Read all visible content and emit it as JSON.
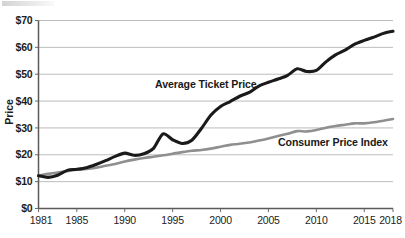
{
  "chart_data": {
    "type": "line",
    "title": "",
    "subtitle": "",
    "xlabel": "",
    "ylabel": "Price",
    "xlim": [
      1981,
      2018
    ],
    "ylim": [
      0,
      70
    ],
    "grid": true,
    "grid_axis": "y",
    "legend_position": "inline-annotations",
    "x_ticks": [
      1981,
      1985,
      1990,
      1995,
      2000,
      2005,
      2010,
      2015,
      2018
    ],
    "x_tick_labels": [
      "1981",
      "1985",
      "1990",
      "1995",
      "2000",
      "2005",
      "2010",
      "2015",
      "2018"
    ],
    "y_ticks": [
      0,
      10,
      20,
      30,
      40,
      50,
      60,
      70
    ],
    "y_tick_labels": [
      "$0",
      "$10",
      "$20",
      "$30",
      "$40",
      "$50",
      "$60",
      "$70"
    ],
    "x": [
      1981,
      1982,
      1983,
      1984,
      1985,
      1986,
      1987,
      1988,
      1989,
      1990,
      1991,
      1992,
      1993,
      1994,
      1995,
      1996,
      1997,
      1998,
      1999,
      2000,
      2001,
      2002,
      2003,
      2004,
      2005,
      2006,
      2007,
      2008,
      2009,
      2010,
      2011,
      2012,
      2013,
      2014,
      2015,
      2016,
      2017,
      2018
    ],
    "series": [
      {
        "name": "Average Ticket Price",
        "color": "#1a1a1a",
        "annotation": "Average Ticket Price",
        "values": [
          12.2,
          11.6,
          12.4,
          14.2,
          14.6,
          15.2,
          16.4,
          17.8,
          19.4,
          20.6,
          19.8,
          20.4,
          22.4,
          27.8,
          25.6,
          24.2,
          25.4,
          29.8,
          34.8,
          38.0,
          39.8,
          41.8,
          43.2,
          45.6,
          47.0,
          48.2,
          49.6,
          52.0,
          51.0,
          51.4,
          54.6,
          57.2,
          59.0,
          61.2,
          62.6,
          63.8,
          65.2,
          66.0
        ]
      },
      {
        "name": "Consumer Price Index",
        "color": "#8f8f8f",
        "annotation": "Consumer Price Index",
        "values": [
          12.2,
          12.9,
          13.4,
          13.9,
          14.4,
          14.7,
          15.2,
          15.9,
          16.6,
          17.5,
          18.2,
          18.8,
          19.3,
          19.8,
          20.4,
          21.0,
          21.5,
          21.8,
          22.3,
          23.0,
          23.7,
          24.1,
          24.6,
          25.3,
          26.1,
          27.0,
          27.8,
          28.8,
          28.7,
          29.2,
          30.1,
          30.7,
          31.2,
          31.7,
          31.7,
          32.1,
          32.7,
          33.3
        ]
      }
    ],
    "annotations": [
      {
        "text": "Average Ticket Price",
        "x_px": 155,
        "y_px": 88
      },
      {
        "text": "Consumer Price Index",
        "x_px": 278,
        "y_px": 146
      }
    ],
    "colors": {
      "ticket_line": "#1a1a1a",
      "cpi_line": "#8f8f8f",
      "gridline": "#b4b4b4",
      "axis": "#5a5a5a",
      "text": "#1c1c1c",
      "background": "#ffffff"
    }
  }
}
